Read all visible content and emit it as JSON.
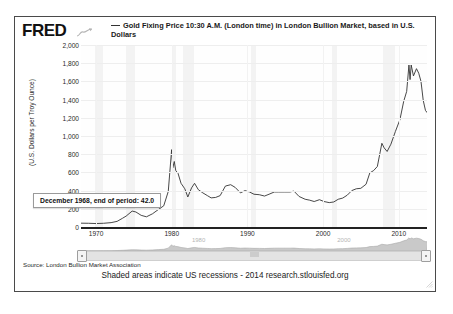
{
  "brand": {
    "logo_text": "FRED",
    "logo_mark_icon": "squiggle-chart-icon"
  },
  "legend": {
    "line_marker_icon": "legend-line-icon",
    "label": "Gold Fixing Price 10:30 A.M. (London time) in London Bullion Market, based in U.S. Dollars"
  },
  "tooltip": {
    "text": "December 1968, end of period: 42.0"
  },
  "navigator": {
    "left_handle_icon": "nav-handle-left-icon",
    "right_handle_icon": "nav-handle-right-icon",
    "grip_icon": "nav-grip-icon",
    "labels": [
      "1980",
      "2000"
    ]
  },
  "footer": {
    "source": "Source: London Bullion Market Association",
    "note": "Shaded areas indicate US recessions - 2014 research.stlouisfed.org",
    "resize_icon": "resize-grip-icon"
  },
  "chart_data": {
    "type": "line",
    "title": "Gold Fixing Price 10:30 A.M. (London time) in London Bullion Market, based in U.S. Dollars",
    "xlabel": "",
    "ylabel": "(U.S. Dollars per Troy Ounce)",
    "ylim": [
      0,
      2000
    ],
    "xlim": [
      1968,
      2014
    ],
    "grid": true,
    "legend_position": "top",
    "yticks": [
      "2,000",
      "1,800",
      "1,600",
      "1,400",
      "1,200",
      "1,000",
      "800",
      "600",
      "400",
      "200",
      "0"
    ],
    "ytick_values": [
      2000,
      1800,
      1600,
      1400,
      1200,
      1000,
      800,
      600,
      400,
      200,
      0
    ],
    "xticks": [
      "1970",
      "1980",
      "1990",
      "2000",
      "2010"
    ],
    "xtick_values": [
      1970,
      1980,
      1990,
      2000,
      2010
    ],
    "series": [
      {
        "name": "Gold Fixing Price 10:30 A.M. (London time) in London Bullion Market, based in U.S. Dollars",
        "color": "#333333",
        "x": [
          1968.0,
          1969.0,
          1970.0,
          1971.0,
          1972.0,
          1972.8,
          1973.5,
          1974.0,
          1974.8,
          1975.3,
          1976.0,
          1976.7,
          1977.5,
          1978.3,
          1979.0,
          1979.6,
          1980.05,
          1980.2,
          1980.4,
          1980.6,
          1980.9,
          1981.3,
          1981.8,
          1982.2,
          1982.7,
          1983.1,
          1983.6,
          1984.2,
          1984.8,
          1985.3,
          1985.9,
          1986.5,
          1987.2,
          1987.9,
          1988.5,
          1989.2,
          1989.8,
          1990.4,
          1991.0,
          1991.7,
          1992.4,
          1993.0,
          1993.7,
          1994.3,
          1995.0,
          1995.8,
          1996.3,
          1997.0,
          1997.8,
          1998.4,
          1999.0,
          1999.7,
          2000.3,
          2001.0,
          2001.6,
          2002.2,
          2002.8,
          2003.4,
          2004.0,
          2004.6,
          2005.2,
          2005.9,
          2006.4,
          2006.9,
          2007.4,
          2008.0,
          2008.3,
          2008.7,
          2009.2,
          2009.8,
          2010.4,
          2010.9,
          2011.3,
          2011.6,
          2011.75,
          2011.9,
          2012.2,
          2012.6,
          2012.9,
          2013.2,
          2013.5,
          2013.8,
          2014.1
        ],
        "y": [
          42.0,
          41.0,
          38.0,
          41.0,
          48.0,
          62.0,
          95.0,
          120.0,
          175.0,
          165.0,
          128.0,
          112.0,
          145.0,
          193.0,
          233.0,
          390.0,
          850.0,
          650.0,
          720.0,
          620.0,
          590.0,
          480.0,
          420.0,
          330.0,
          430.0,
          480.0,
          410.0,
          375.0,
          345.0,
          320.0,
          325.0,
          345.0,
          450.0,
          465.0,
          435.0,
          375.0,
          400.0,
          385.0,
          360.0,
          355.0,
          340.0,
          360.0,
          385.0,
          385.0,
          385.0,
          385.0,
          395.0,
          335.0,
          305.0,
          295.0,
          280.0,
          300.0,
          280.0,
          268.0,
          275.0,
          305.0,
          318.0,
          350.0,
          400.0,
          420.0,
          425.0,
          470.0,
          595.0,
          620.0,
          665.0,
          920.0,
          870.0,
          830.0,
          910.0,
          1050.0,
          1180.0,
          1380.0,
          1490.0,
          1780.0,
          1620.0,
          1780.0,
          1660.0,
          1740.0,
          1690.0,
          1600.0,
          1390.0,
          1280.0,
          1250.0
        ]
      }
    ],
    "recessions": [
      {
        "start": 1969.9,
        "end": 1970.9
      },
      {
        "start": 1973.9,
        "end": 1975.2
      },
      {
        "start": 1980.0,
        "end": 1980.5
      },
      {
        "start": 1981.5,
        "end": 1982.9
      },
      {
        "start": 1990.5,
        "end": 1991.2
      },
      {
        "start": 2001.2,
        "end": 2001.9
      },
      {
        "start": 2007.9,
        "end": 2009.5
      }
    ],
    "annotations": [
      {
        "text": "December 1968, end of period: 42.0",
        "x": 1968.0,
        "y": 42.0
      }
    ]
  }
}
